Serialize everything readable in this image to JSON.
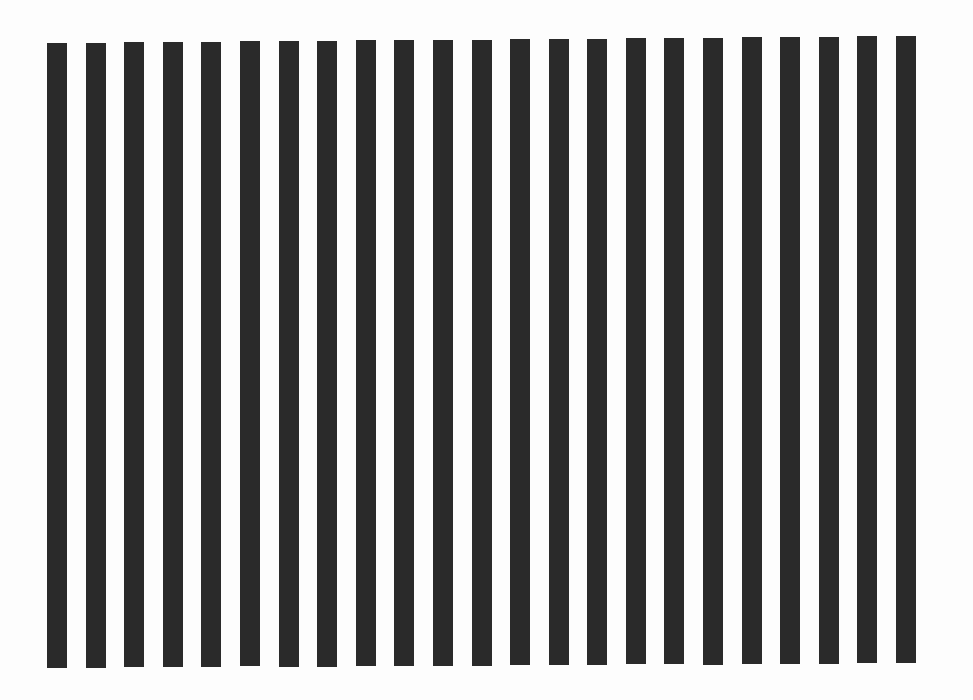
{
  "image": {
    "description": "Vertical square-wave grating: dark bars on white background",
    "width": 973,
    "height": 700,
    "background_color": "#fdfdfd",
    "bar_color": "#2a2a2a",
    "bar_count": 23,
    "bar_width": 20,
    "first_bar": {
      "x": 47,
      "top": 43,
      "bottom": 668
    },
    "last_bar": {
      "x": 896,
      "top": 36,
      "bottom": 663
    }
  }
}
